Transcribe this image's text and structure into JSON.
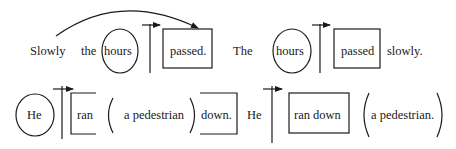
{
  "colors": {
    "ink": "#1a1a1a",
    "background": "#ffffff"
  },
  "row1": {
    "left": {
      "words": [
        "Slowly",
        "the",
        "hours",
        "passed."
      ],
      "circled": "hours",
      "boxed": "passed.",
      "arrow": "curved-arrow from Slowly to passed."
    },
    "right": {
      "words": [
        "The",
        "hours",
        "passed",
        "slowly."
      ],
      "circled": "hours",
      "boxed": "passed"
    }
  },
  "row2": {
    "left": {
      "words": [
        "He",
        "ran",
        "a pedestrian",
        "down."
      ],
      "circled": "He",
      "bracketed_open": "ran",
      "parenthesized": "a pedestrian",
      "bracketed_close": "down."
    },
    "right": {
      "words": [
        "He",
        "ran down",
        "a pedestrian."
      ],
      "boxed": "ran down",
      "parenthesized": "a pedestrian."
    }
  }
}
